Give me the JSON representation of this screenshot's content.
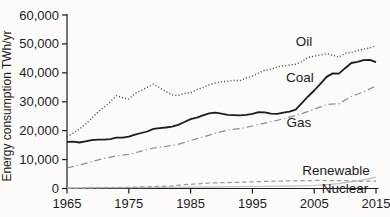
{
  "chart_data": {
    "type": "line",
    "title": "",
    "xlabel": "",
    "ylabel": "Energy consumption TWh/yr",
    "xlim": [
      1965,
      2015
    ],
    "ylim": [
      0,
      60000
    ],
    "grid": false,
    "legend_position": "inline-labels-on-plot",
    "x_ticks": [
      1965,
      1975,
      1985,
      1995,
      2005,
      2015
    ],
    "y_ticks": [
      0,
      10000,
      20000,
      30000,
      40000,
      50000,
      60000
    ],
    "y_tick_labels": [
      "0",
      "10,000",
      "20,000",
      "30,000",
      "40,000",
      "50,000",
      "60,000"
    ],
    "axis_color": "#1c1c1c",
    "series": [
      {
        "name": "Oil",
        "style": "dotted",
        "color": "#3f3f3f",
        "width": 1.4,
        "label": {
          "x": 304,
          "y": 46
        },
        "points": [
          [
            1965,
            17900
          ],
          [
            1966,
            19200
          ],
          [
            1967,
            20500
          ],
          [
            1968,
            22300
          ],
          [
            1969,
            24300
          ],
          [
            1970,
            26500
          ],
          [
            1971,
            28100
          ],
          [
            1972,
            30000
          ],
          [
            1973,
            32100
          ],
          [
            1974,
            31400
          ],
          [
            1975,
            30900
          ],
          [
            1976,
            32900
          ],
          [
            1977,
            33900
          ],
          [
            1978,
            35000
          ],
          [
            1979,
            36100
          ],
          [
            1980,
            34800
          ],
          [
            1981,
            33500
          ],
          [
            1982,
            32400
          ],
          [
            1983,
            32200
          ],
          [
            1984,
            32900
          ],
          [
            1985,
            33100
          ],
          [
            1986,
            34200
          ],
          [
            1987,
            34900
          ],
          [
            1988,
            35900
          ],
          [
            1989,
            36500
          ],
          [
            1990,
            36900
          ],
          [
            1991,
            37100
          ],
          [
            1992,
            37400
          ],
          [
            1993,
            37300
          ],
          [
            1994,
            38200
          ],
          [
            1995,
            38900
          ],
          [
            1996,
            39900
          ],
          [
            1997,
            40900
          ],
          [
            1998,
            41200
          ],
          [
            1999,
            42000
          ],
          [
            2000,
            42400
          ],
          [
            2001,
            42700
          ],
          [
            2002,
            43000
          ],
          [
            2003,
            43900
          ],
          [
            2004,
            45300
          ],
          [
            2005,
            45800
          ],
          [
            2006,
            46200
          ],
          [
            2007,
            46600
          ],
          [
            2008,
            46100
          ],
          [
            2009,
            45400
          ],
          [
            2010,
            46800
          ],
          [
            2011,
            47100
          ],
          [
            2012,
            47700
          ],
          [
            2013,
            48200
          ],
          [
            2014,
            48600
          ],
          [
            2015,
            49400
          ]
        ]
      },
      {
        "name": "Coal",
        "style": "solid",
        "color": "#1c1c1c",
        "width": 1.8,
        "label": {
          "x": 300,
          "y": 82
        },
        "points": [
          [
            1965,
            16100
          ],
          [
            1966,
            16200
          ],
          [
            1967,
            15900
          ],
          [
            1968,
            16300
          ],
          [
            1969,
            16700
          ],
          [
            1970,
            16900
          ],
          [
            1971,
            16900
          ],
          [
            1972,
            17100
          ],
          [
            1973,
            17600
          ],
          [
            1974,
            17600
          ],
          [
            1975,
            17900
          ],
          [
            1976,
            18600
          ],
          [
            1977,
            19200
          ],
          [
            1978,
            19700
          ],
          [
            1979,
            20600
          ],
          [
            1980,
            20900
          ],
          [
            1981,
            21100
          ],
          [
            1982,
            21400
          ],
          [
            1983,
            22000
          ],
          [
            1984,
            23000
          ],
          [
            1985,
            24000
          ],
          [
            1986,
            24500
          ],
          [
            1987,
            25300
          ],
          [
            1988,
            26000
          ],
          [
            1989,
            26200
          ],
          [
            1990,
            25900
          ],
          [
            1991,
            25500
          ],
          [
            1992,
            25400
          ],
          [
            1993,
            25300
          ],
          [
            1994,
            25500
          ],
          [
            1995,
            25800
          ],
          [
            1996,
            26400
          ],
          [
            1997,
            26300
          ],
          [
            1998,
            25900
          ],
          [
            1999,
            25800
          ],
          [
            2000,
            26200
          ],
          [
            2001,
            26600
          ],
          [
            2002,
            27300
          ],
          [
            2003,
            29500
          ],
          [
            2004,
            31800
          ],
          [
            2005,
            33900
          ],
          [
            2006,
            36200
          ],
          [
            2007,
            38600
          ],
          [
            2008,
            39800
          ],
          [
            2009,
            39700
          ],
          [
            2010,
            41600
          ],
          [
            2011,
            43400
          ],
          [
            2012,
            43800
          ],
          [
            2013,
            44400
          ],
          [
            2014,
            44500
          ],
          [
            2015,
            43700
          ]
        ]
      },
      {
        "name": "Gas",
        "style": "dashdot",
        "color": "#8f8f8c",
        "width": 1.25,
        "label": {
          "x": 299,
          "y": 127
        },
        "points": [
          [
            1965,
            7100
          ],
          [
            1967,
            8100
          ],
          [
            1969,
            9300
          ],
          [
            1971,
            10400
          ],
          [
            1973,
            11300
          ],
          [
            1975,
            11800
          ],
          [
            1977,
            12900
          ],
          [
            1979,
            14000
          ],
          [
            1981,
            14600
          ],
          [
            1983,
            15300
          ],
          [
            1985,
            16600
          ],
          [
            1987,
            17800
          ],
          [
            1989,
            19100
          ],
          [
            1991,
            20200
          ],
          [
            1993,
            20700
          ],
          [
            1995,
            21600
          ],
          [
            1997,
            22600
          ],
          [
            1999,
            23600
          ],
          [
            2001,
            24700
          ],
          [
            2003,
            25900
          ],
          [
            2005,
            27400
          ],
          [
            2007,
            29100
          ],
          [
            2009,
            29300
          ],
          [
            2011,
            31800
          ],
          [
            2013,
            33400
          ],
          [
            2015,
            35500
          ]
        ]
      },
      {
        "name": "Renewable",
        "style": "solid",
        "color": "#bfbfbb",
        "width": 1.2,
        "label": {
          "x": 336,
          "y": 175
        },
        "points": [
          [
            1965,
            250
          ],
          [
            1970,
            280
          ],
          [
            1975,
            310
          ],
          [
            1980,
            370
          ],
          [
            1985,
            470
          ],
          [
            1990,
            580
          ],
          [
            1995,
            680
          ],
          [
            2000,
            790
          ],
          [
            2003,
            900
          ],
          [
            2005,
            1050
          ],
          [
            2007,
            1350
          ],
          [
            2009,
            1700
          ],
          [
            2011,
            2350
          ],
          [
            2013,
            3000
          ],
          [
            2015,
            3900
          ]
        ]
      },
      {
        "name": "Nuclear",
        "style": "dashed",
        "color": "#9b9b98",
        "width": 1.25,
        "label": {
          "x": 345,
          "y": 193
        },
        "points": [
          [
            1965,
            30
          ],
          [
            1970,
            220
          ],
          [
            1975,
            400
          ],
          [
            1978,
            600
          ],
          [
            1980,
            710
          ],
          [
            1982,
            900
          ],
          [
            1984,
            1300
          ],
          [
            1986,
            1600
          ],
          [
            1988,
            1900
          ],
          [
            1990,
            2000
          ],
          [
            1992,
            2100
          ],
          [
            1994,
            2200
          ],
          [
            1996,
            2400
          ],
          [
            1998,
            2500
          ],
          [
            2000,
            2590
          ],
          [
            2002,
            2660
          ],
          [
            2004,
            2740
          ],
          [
            2006,
            2790
          ],
          [
            2008,
            2730
          ],
          [
            2010,
            2760
          ],
          [
            2012,
            2460
          ],
          [
            2014,
            2540
          ],
          [
            2015,
            2570
          ]
        ]
      }
    ]
  }
}
